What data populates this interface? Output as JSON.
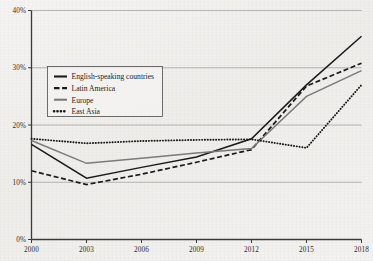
{
  "chart_data": {
    "type": "line",
    "title": "",
    "xlabel": "",
    "ylabel": "",
    "x": [
      2000,
      2003,
      2006,
      2009,
      2012,
      2015,
      2018
    ],
    "categories": [
      "2000",
      "2003",
      "2006",
      "2009",
      "2012",
      "2015",
      "2018"
    ],
    "xlim": [
      2000,
      2018
    ],
    "ylim": [
      0,
      40
    ],
    "ytick_values": [
      0,
      10,
      20,
      30,
      40
    ],
    "ytick_labels": [
      "0%",
      "10%",
      "20%",
      "30%",
      "40%"
    ],
    "xtick_labels": [
      "2000",
      "2003",
      "2006",
      "2009",
      "2012",
      "2015",
      "2018"
    ],
    "grid": "horizontal",
    "legend_position": "upper-left-inside",
    "series": [
      {
        "name": "English-speaking countries",
        "style": "solid",
        "color": "#1a1a1a",
        "values": [
          16.6,
          10.7,
          12.6,
          14.4,
          17.6,
          27.0,
          35.5
        ]
      },
      {
        "name": "Latin America",
        "style": "dashed",
        "color": "#1a1a1a",
        "values": [
          12.0,
          9.6,
          11.4,
          13.5,
          15.7,
          26.8,
          30.8
        ]
      },
      {
        "name": "Europe",
        "style": "solid",
        "color": "#7a7a7a",
        "values": [
          17.3,
          13.3,
          14.2,
          15.1,
          15.9,
          25.0,
          29.5
        ]
      },
      {
        "name": "East Asia",
        "style": "dotted",
        "color": "#1a1a1a",
        "values": [
          17.6,
          16.8,
          17.2,
          17.4,
          17.5,
          16.0,
          27.0
        ]
      }
    ]
  },
  "legend": {
    "items": [
      {
        "label": "English-speaking countries"
      },
      {
        "label": "Latin America"
      },
      {
        "label": "Europe"
      },
      {
        "label": "East Asia"
      }
    ]
  }
}
